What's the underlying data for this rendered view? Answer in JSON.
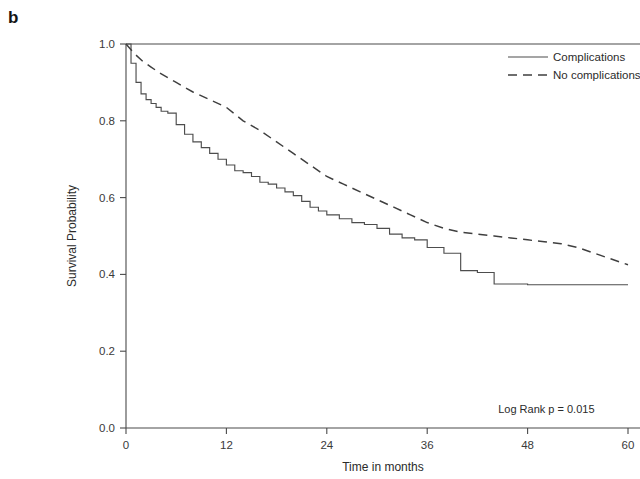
{
  "panel": {
    "label": "b"
  },
  "chart_data": {
    "type": "line",
    "title": "",
    "subtitle": "",
    "xlabel": "Time in months",
    "ylabel": "Survival Probability",
    "xlim": [
      0,
      60
    ],
    "ylim": [
      0.0,
      1.0
    ],
    "xticks": [
      0,
      12,
      24,
      36,
      48,
      60
    ],
    "xtick_labels": [
      "0",
      "12",
      "24",
      "36",
      "48",
      "60"
    ],
    "yticks": [
      0.0,
      0.2,
      0.4,
      0.6,
      0.8,
      1.0
    ],
    "ytick_labels": [
      "0.0",
      "0.2",
      "0.4",
      "0.6",
      "0.8",
      "1.0"
    ],
    "grid": false,
    "legend_position": "top-right",
    "annotations": [
      {
        "name": "log-rank-p",
        "text": "Log Rank p =  0.015",
        "x": 56,
        "y": 0.04
      }
    ],
    "series": [
      {
        "name": "Complications",
        "style": "solid",
        "color": "#4d4d4d",
        "step": true,
        "x": [
          0,
          0.6,
          1.2,
          1.8,
          2.4,
          3.0,
          3.6,
          4.2,
          5.0,
          6.0,
          7.0,
          8.0,
          9.0,
          10.0,
          11.0,
          12.0,
          13.0,
          14.0,
          15.0,
          16.0,
          17.0,
          18.0,
          19.0,
          20.0,
          21.0,
          22.0,
          23.0,
          24.0,
          25.5,
          27.0,
          28.5,
          30.0,
          31.5,
          33.0,
          34.5,
          36.0,
          38.0,
          40.0,
          42.0,
          44.0,
          48.0,
          52.0,
          56.0,
          60.0
        ],
        "y": [
          1.0,
          0.95,
          0.9,
          0.87,
          0.855,
          0.845,
          0.835,
          0.825,
          0.82,
          0.79,
          0.765,
          0.745,
          0.73,
          0.715,
          0.7,
          0.685,
          0.67,
          0.665,
          0.655,
          0.64,
          0.635,
          0.625,
          0.615,
          0.605,
          0.59,
          0.575,
          0.565,
          0.555,
          0.545,
          0.535,
          0.53,
          0.52,
          0.505,
          0.495,
          0.49,
          0.47,
          0.455,
          0.41,
          0.405,
          0.375,
          0.373,
          0.373,
          0.373,
          0.373
        ]
      },
      {
        "name": "No complications",
        "style": "dashed",
        "color": "#3f3f3f",
        "step": false,
        "x": [
          0,
          1,
          2,
          3,
          4,
          6,
          8,
          10,
          12,
          14,
          16,
          18,
          20,
          22,
          24,
          26,
          28,
          30,
          32,
          34,
          36,
          38,
          40,
          42,
          44,
          46,
          48,
          50,
          52,
          54,
          56,
          58,
          60
        ],
        "y": [
          1.0,
          0.975,
          0.955,
          0.94,
          0.925,
          0.9,
          0.875,
          0.855,
          0.835,
          0.8,
          0.775,
          0.745,
          0.715,
          0.685,
          0.655,
          0.635,
          0.615,
          0.595,
          0.575,
          0.555,
          0.535,
          0.52,
          0.51,
          0.505,
          0.5,
          0.495,
          0.49,
          0.485,
          0.48,
          0.47,
          0.455,
          0.44,
          0.425
        ]
      }
    ]
  },
  "legend": {
    "items": [
      {
        "label": "Complications",
        "style": "solid"
      },
      {
        "label": "No complications",
        "style": "dashed"
      }
    ]
  },
  "colors": {
    "axis": "#4a4a4a",
    "solid_series": "#4d4d4d",
    "dashed_series": "#3f3f3f",
    "background": "#ffffff",
    "text": "#2b2b2b"
  }
}
